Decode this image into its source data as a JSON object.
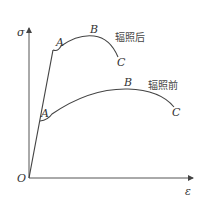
{
  "diagram": {
    "type": "stress-strain curve",
    "axes": {
      "y_label": "σ",
      "x_label": "ε",
      "origin_label": "O"
    },
    "curves": [
      {
        "name": "after-irradiation",
        "label": "辐照后",
        "points": {
          "A": "A",
          "B": "B",
          "C": "C"
        }
      },
      {
        "name": "before-irradiation",
        "label": "辐照前",
        "points": {
          "A": "A",
          "B": "B",
          "C": "C"
        }
      }
    ]
  }
}
